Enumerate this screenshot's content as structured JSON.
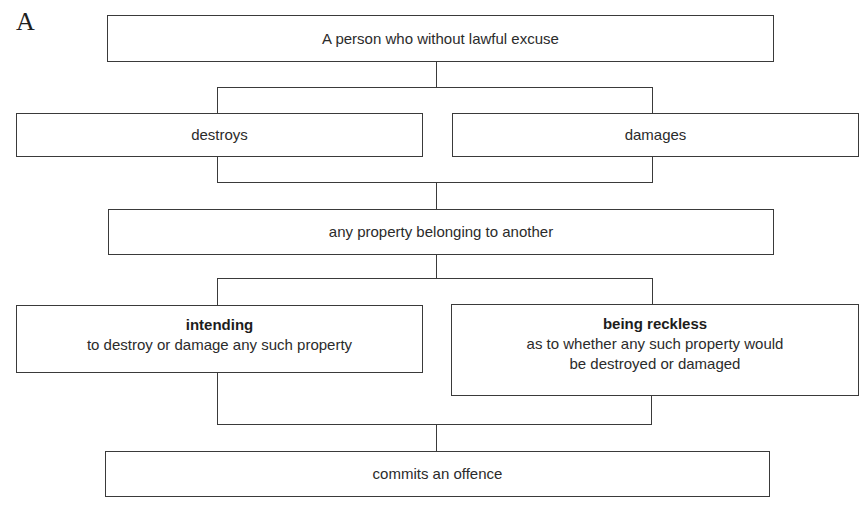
{
  "diagram": {
    "corner_label": "A",
    "nodes": {
      "person": {
        "text": "A person who without lawful excuse"
      },
      "destroys": {
        "text": "destroys"
      },
      "damages": {
        "text": "damages"
      },
      "property": {
        "text": "any property belonging to another"
      },
      "intending": {
        "title": "intending",
        "text": "to destroy or damage any such property"
      },
      "reckless": {
        "title": "being reckless",
        "line1": "as to whether any such property would",
        "line2": "be destroyed or damaged"
      },
      "offence": {
        "text": "commits an offence"
      }
    },
    "colors": {
      "stroke": "#3a3a3a",
      "text": "#2b2b2b",
      "background": "#ffffff"
    }
  }
}
